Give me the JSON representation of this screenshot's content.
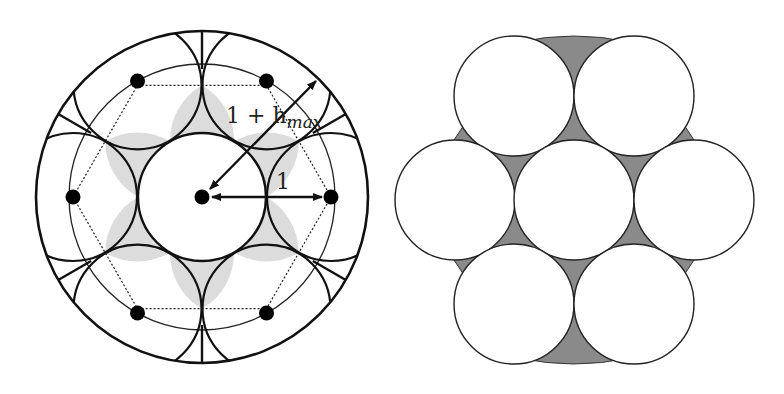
{
  "figure": {
    "left_panel": {
      "title": "Cylindrical cell with central disc and six neighbours",
      "labels": {
        "outer_radius_main": "1 + h",
        "outer_radius_sub": "max",
        "unit_radius": "1"
      },
      "geometry": {
        "center": [
          202,
          197
        ],
        "outer_circle_radius": 166,
        "dot_ring_radius": 129,
        "thin_circle_radius": 133,
        "disc_radius": 64,
        "dot_count": 6,
        "radial_line_count": 6
      },
      "colors": {
        "stroke": "#111111",
        "shaded_region": "#dcdcdc",
        "background": "#ffffff"
      }
    },
    "right_panel": {
      "title": "Hexagonal packing of seven circles",
      "geometry": {
        "center": [
          574,
          200
        ],
        "enclosing_radius": 160,
        "circle_radius": 60,
        "circle_count": 7
      },
      "colors": {
        "stroke": "#222222",
        "gap_fill": "#8a8a8a",
        "circle_fill": "#ffffff"
      }
    }
  }
}
